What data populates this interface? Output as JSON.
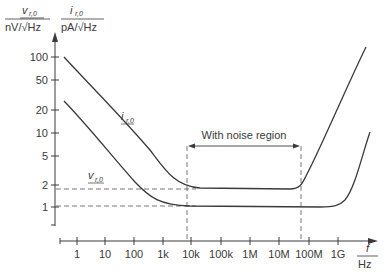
{
  "chart_data": {
    "type": "line",
    "title": "",
    "xlabel": "f / Hz",
    "ylabel_left": "v_r,0 / nV/√Hz",
    "ylabel_right": "i_r,0 / pA/√Hz",
    "x_scale": "log",
    "y_scale": "log",
    "x_ticks": [
      "1",
      "10",
      "100",
      "1k",
      "10k",
      "100k",
      "1M",
      "10M",
      "100M",
      "1G"
    ],
    "y_ticks": [
      "1",
      "2",
      "5",
      "10",
      "20",
      "50",
      "100"
    ],
    "xlim": [
      0.5,
      10000000000
    ],
    "ylim": [
      0.6,
      120
    ],
    "grid": false,
    "series": [
      {
        "name": "i_r,0",
        "x": [
          0.5,
          1,
          10,
          100,
          1000,
          10000,
          100000,
          1000000,
          10000000,
          50000000,
          100000000,
          1000000000,
          5000000000
        ],
        "values": [
          100,
          70,
          30,
          12,
          4.5,
          1.9,
          1.85,
          1.85,
          1.85,
          1.9,
          3,
          30,
          120
        ]
      },
      {
        "name": "v_r,0",
        "x": [
          0.5,
          1,
          10,
          100,
          1000,
          10000,
          100000,
          1000000,
          10000000,
          100000000,
          1000000000,
          3000000000,
          5000000000
        ],
        "values": [
          25,
          18,
          7,
          2.8,
          1.3,
          1.1,
          1.08,
          1.07,
          1.07,
          1.07,
          1.1,
          3,
          5
        ]
      }
    ],
    "annotations": [
      {
        "text": "With noise region",
        "x_range": [
          "~7k",
          "~60M"
        ],
        "type": "double-arrow"
      },
      {
        "text": "dashed reference",
        "y": 1.85
      },
      {
        "text": "dashed reference",
        "y": 1.07
      }
    ]
  },
  "labels": {
    "y_left_num": "v",
    "y_left_sub": "r,0",
    "y_left_unit": "nV/√Hz",
    "y_right_num": "i",
    "y_right_sub": "r,0",
    "y_right_unit": "pA/√Hz",
    "x_num": "f",
    "x_unit": "Hz",
    "curve_i": "i",
    "curve_i_sub": "r,0",
    "curve_v": "v",
    "curve_v_sub": "r,0",
    "region": "With noise region"
  },
  "ticks": {
    "y": [
      {
        "label": "100",
        "y": 57
      },
      {
        "label": "50",
        "y": 80
      },
      {
        "label": "20",
        "y": 110
      },
      {
        "label": "10",
        "y": 133
      },
      {
        "label": "5",
        "y": 156
      },
      {
        "label": "2",
        "y": 185
      },
      {
        "label": "1",
        "y": 207
      }
    ],
    "x": [
      {
        "label": "1",
        "x": 77
      },
      {
        "label": "10",
        "x": 105
      },
      {
        "label": "100",
        "x": 134
      },
      {
        "label": "1k",
        "x": 163
      },
      {
        "label": "10k",
        "x": 191
      },
      {
        "label": "100k",
        "x": 221
      },
      {
        "label": "1M",
        "x": 250
      },
      {
        "label": "10M",
        "x": 279
      },
      {
        "label": "100M",
        "x": 309
      },
      {
        "label": "1G",
        "x": 338
      }
    ]
  },
  "colors": {
    "curve": "#3a3a3a",
    "axis": "#3a3a3a",
    "dashed": "#6a6a6a"
  }
}
